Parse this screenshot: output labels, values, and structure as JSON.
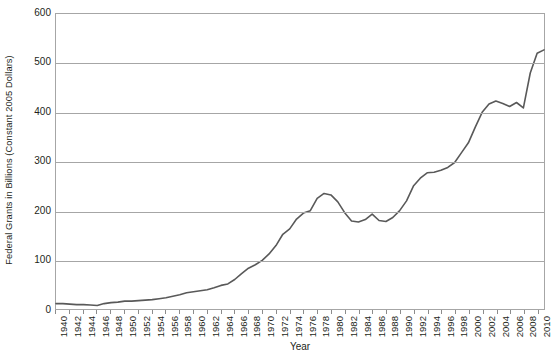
{
  "chart_data": {
    "type": "line",
    "title": "",
    "xlabel": "Year",
    "ylabel": "Federal Grants in Billions (Constant 2005 Dollars)",
    "ylim": [
      0,
      600
    ],
    "yticks": [
      0,
      100,
      200,
      300,
      400,
      500,
      600
    ],
    "ytick_labels": [
      "0",
      "100",
      "200",
      "300",
      "400",
      "500",
      "600"
    ],
    "xlim": [
      1940,
      2011
    ],
    "xtick_labels": [
      "1940",
      "1942",
      "1944",
      "1946",
      "1948",
      "1950",
      "1952",
      "1954",
      "1956",
      "1958",
      "1960",
      "1962",
      "1964",
      "1966",
      "1968",
      "1970",
      "1972",
      "1974",
      "1976",
      "1978",
      "1980",
      "1982",
      "1984",
      "1986",
      "1988",
      "1990",
      "1992",
      "1994",
      "1996",
      "1998",
      "2000",
      "2002",
      "2004",
      "2006",
      "2008",
      "2010"
    ],
    "grid": true,
    "legend": "none",
    "line_color": "#595959",
    "grid_color": "#a6a6a6",
    "series": [
      {
        "name": "Federal Grants",
        "x": [
          1940,
          1941,
          1942,
          1943,
          1944,
          1945,
          1946,
          1947,
          1948,
          1949,
          1950,
          1951,
          1952,
          1953,
          1954,
          1955,
          1956,
          1957,
          1958,
          1959,
          1960,
          1961,
          1962,
          1963,
          1964,
          1965,
          1966,
          1967,
          1968,
          1969,
          1970,
          1971,
          1972,
          1973,
          1974,
          1975,
          1976,
          1977,
          1978,
          1979,
          1980,
          1981,
          1982,
          1983,
          1984,
          1985,
          1986,
          1987,
          1988,
          1989,
          1990,
          1991,
          1992,
          1993,
          1994,
          1995,
          1996,
          1997,
          1998,
          1999,
          2000,
          2001,
          2002,
          2003,
          2004,
          2005,
          2006,
          2007,
          2008,
          2009,
          2010,
          2011
        ],
        "values": [
          11,
          11,
          10,
          9,
          9,
          8,
          7,
          11,
          13,
          14,
          16,
          16,
          17,
          18,
          19,
          21,
          23,
          26,
          29,
          33,
          35,
          37,
          39,
          43,
          48,
          51,
          60,
          72,
          83,
          90,
          99,
          112,
          129,
          152,
          163,
          183,
          195,
          200,
          225,
          235,
          232,
          218,
          196,
          179,
          177,
          182,
          193,
          180,
          178,
          186,
          200,
          220,
          250,
          266,
          277,
          278,
          282,
          288,
          298,
          318,
          338,
          370,
          400,
          417,
          423,
          418,
          412,
          420,
          409,
          480,
          520,
          527
        ]
      }
    ]
  },
  "y_axis_title": "Federal Grants in Billions (Constant 2005 Dollars)",
  "x_axis_title": "Year"
}
